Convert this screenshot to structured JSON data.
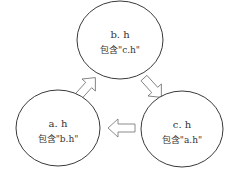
{
  "diagram": {
    "nodes": [
      {
        "id": "b",
        "title": "b. h",
        "subtitle": "包含\"c.h\""
      },
      {
        "id": "a",
        "title": "a. h",
        "subtitle": "包含\"b.h\""
      },
      {
        "id": "c",
        "title": "c. h",
        "subtitle": "包含\"a.h\""
      }
    ],
    "edges": [
      {
        "from": "a",
        "to": "b",
        "style": "hollow-block-arrow"
      },
      {
        "from": "b",
        "to": "c",
        "style": "hollow-block-arrow"
      },
      {
        "from": "c",
        "to": "a",
        "style": "hollow-block-arrow"
      }
    ],
    "colors": {
      "stroke": "#3a3a3a",
      "arrow_stroke": "#707070",
      "text": "#333333",
      "background": "#ffffff"
    }
  }
}
